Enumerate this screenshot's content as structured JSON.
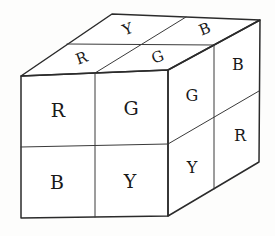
{
  "drawing": {
    "title": "Hand-drawn 2x2x2 cube with lettered facelets",
    "style": "pencil line sketch",
    "background_color": "#fdfdfc",
    "line_color": "#2b2b2b",
    "letter_color": "#191919"
  },
  "cube": {
    "kind": "2x2x2-cube",
    "visible_faces": [
      "front",
      "top",
      "right"
    ],
    "faces": {
      "front": {
        "name": "front-face",
        "rows": 2,
        "cols": 2,
        "cells": [
          {
            "id": "front-top-left",
            "label": "R"
          },
          {
            "id": "front-top-right",
            "label": "G"
          },
          {
            "id": "front-bottom-left",
            "label": "B"
          },
          {
            "id": "front-bottom-right",
            "label": "Y"
          }
        ]
      },
      "top": {
        "name": "top-face",
        "rows": 2,
        "cols": 2,
        "cells": [
          {
            "id": "top-back-left",
            "label": "Y"
          },
          {
            "id": "top-back-right",
            "label": "B"
          },
          {
            "id": "top-front-left",
            "label": "R"
          },
          {
            "id": "top-front-right",
            "label": "G"
          }
        ]
      },
      "right": {
        "name": "right-face",
        "rows": 2,
        "cols": 2,
        "cells": [
          {
            "id": "right-top-front",
            "label": "G"
          },
          {
            "id": "right-top-back",
            "label": "B"
          },
          {
            "id": "right-bottom-front",
            "label": "Y"
          },
          {
            "id": "right-bottom-back",
            "label": "R"
          }
        ]
      }
    }
  },
  "geometry": {
    "front": {
      "top_left": "21,76",
      "top_right": "168,70",
      "bottom_right": "168,216",
      "bottom_left": "21,218"
    },
    "top": {
      "front_left": "21,76",
      "front_right": "168,70",
      "back_right": "260,20",
      "back_left": "112,14"
    },
    "right": {
      "front_top": "168,70",
      "back_top": "260,20",
      "back_bottom": "259,162",
      "front_bottom": "168,216"
    }
  }
}
